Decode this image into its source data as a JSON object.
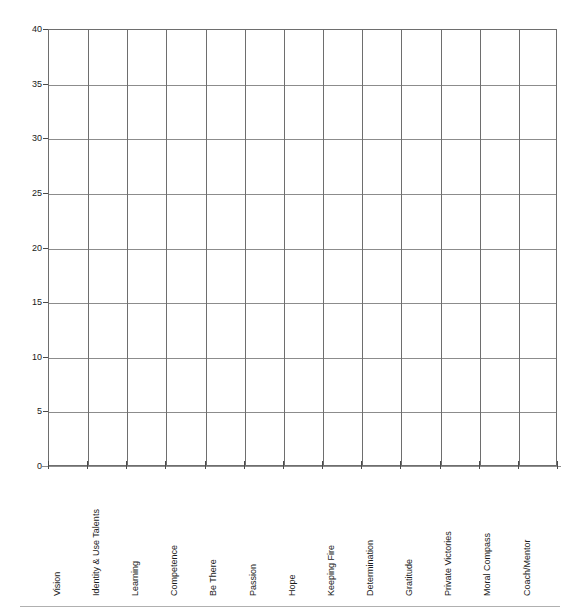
{
  "chart_data": {
    "type": "bar",
    "title": "",
    "subtitle": "",
    "xlabel": "",
    "ylabel": "",
    "categories": [
      "Vision",
      "Identity & Use Talents",
      "Learning",
      "Competence",
      "Be There",
      "Passion",
      "Hope",
      "Keeping Fire",
      "Determination",
      "Gratitude",
      "Private Victories",
      "Moral Compass",
      "Coach/Mentor"
    ],
    "values": [
      0,
      0,
      0,
      0,
      0,
      0,
      0,
      0,
      0,
      0,
      0,
      0,
      0
    ],
    "ylim": [
      0,
      40
    ],
    "ytick_step": 5,
    "ytick_labels": [
      "0",
      "5",
      "10",
      "15",
      "20",
      "25",
      "30",
      "35",
      "40"
    ],
    "ytick_values": [
      0,
      5,
      10,
      15,
      20,
      25,
      30,
      35,
      40
    ],
    "grid": true,
    "grid_horizontal": true,
    "grid_vertical": true,
    "legend": false,
    "legend_position": "none",
    "annotations": []
  },
  "colors": {
    "background": "#ffffff",
    "grid_horizontal": "#8c8c8c",
    "grid_vertical": "#6e6e6e",
    "axis": "#6e6e6e",
    "tick_mark": "#4a4a4a",
    "text": "#1a1a1a",
    "footer_rule": "#b0b0b0"
  }
}
